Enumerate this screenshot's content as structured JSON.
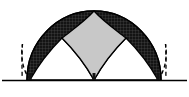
{
  "figure": {
    "title": "Gothic twin-arch dome geometry diagram",
    "canvas": {
      "width": 189,
      "height": 97,
      "background": "#ffffff"
    },
    "colors": {
      "dome_fill": "#c8c8c8",
      "hatch_dark": "#141414",
      "hatch_grid": "#b0b0b0",
      "outline": "#000000",
      "ground_line": "#000000",
      "dashed_arc": "#000000",
      "background": "#ffffff"
    },
    "geometry": {
      "ground_y": 80,
      "ground_x_start": 2,
      "ground_x_end": 187,
      "dome_center_x": 94,
      "dome_apex_y": 11,
      "dome_left_x": 27,
      "dome_right_x": 161,
      "dome_radius_x": 67,
      "dome_radius_y": 69,
      "arch_left_foot_x": 30,
      "arch_center_foot_x": 94,
      "arch_right_foot_x": 158,
      "arch_left_peak_x": 62,
      "arch_left_peak_y": 38,
      "arch_right_peak_x": 126,
      "arch_right_peak_y": 38,
      "dashed_left_foot_x": 22,
      "dashed_right_foot_x": 166
    },
    "elements": {
      "dome_label": "shaded semicircular dome",
      "left_arch_label": "left hatched pointed arch",
      "right_arch_label": "right hatched pointed arch",
      "left_dashed_label": "left dashed continuation arc",
      "right_dashed_label": "right dashed continuation arc",
      "ground_label": "ground baseline"
    }
  }
}
